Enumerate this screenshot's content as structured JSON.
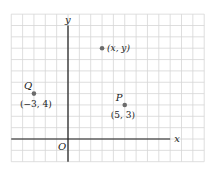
{
  "diagram": {
    "title": "",
    "colors": {
      "grid": "#d6d6d6",
      "axis": "#1a1a1a",
      "point": "#6b6b6b",
      "text": "#222222",
      "background": "#ffffff"
    },
    "grid": {
      "x_min": -5,
      "x_max": 12,
      "y_min": -2,
      "y_max": 11,
      "step": 1
    },
    "axes": {
      "x_label": "x",
      "y_label": "y",
      "origin_label": "O",
      "x_axis_range": [
        -5,
        9
      ],
      "y_axis_range": [
        -2,
        10
      ]
    },
    "points": [
      {
        "name": "Q",
        "x": -3,
        "y": 4,
        "coord_label": "(−3, 4)"
      },
      {
        "name": "P",
        "x": 5,
        "y": 3,
        "coord_label": "(5, 3)"
      },
      {
        "name": "",
        "x": 3,
        "y": 8,
        "coord_label": "(x, y)"
      }
    ]
  }
}
